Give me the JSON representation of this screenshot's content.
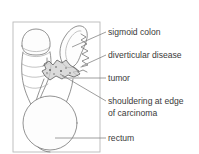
{
  "figure": {
    "frame": {
      "x": 13,
      "y": 22,
      "width": 87,
      "height": 130
    },
    "colors": {
      "background": "#ffffff",
      "frame_stroke": "#b9b9b9",
      "organ_stroke": "#6f6f6f",
      "organ_stroke_light": "#9a9a9a",
      "tumor_fill": "#cfcfcf",
      "tumor_stroke": "#5d5d5d",
      "leader_line": "#7d7d7d",
      "label_text": "#3a3a3a"
    },
    "structures": [
      {
        "name": "descending-colon",
        "label": "descending colon"
      },
      {
        "name": "sigmoid-colon-loop",
        "label": "sigmoid colon loop"
      },
      {
        "name": "diverticula-zigzag",
        "label": "diverticula"
      },
      {
        "name": "tumor-mass",
        "label": "tumour mass"
      },
      {
        "name": "rectum-circle",
        "label": "rectum"
      }
    ],
    "labels": [
      {
        "id": "sigmoid-colon",
        "lines": [
          "sigmoid colon"
        ],
        "text_x": 108,
        "text_y": 35,
        "leader": "M 106 32 L 72 47"
      },
      {
        "id": "diverticular-disease",
        "lines": [
          "diverticular disease"
        ],
        "text_x": 108,
        "text_y": 58,
        "leader": "M 106 55 L 82 66"
      },
      {
        "id": "tumor",
        "lines": [
          "tumor"
        ],
        "text_x": 108,
        "text_y": 81,
        "leader": "M 106 78 L 64 78"
      },
      {
        "id": "shouldering-at-edge-of-carcinoma",
        "lines": [
          "shouldering at edge",
          "of carcinoma"
        ],
        "text_x": 108,
        "text_y": 104,
        "leader": "M 106 101 L 60 74"
      },
      {
        "id": "rectum",
        "lines": [
          "rectum"
        ],
        "text_x": 108,
        "text_y": 141,
        "leader": "M 106 138 L 55 138"
      }
    ]
  }
}
